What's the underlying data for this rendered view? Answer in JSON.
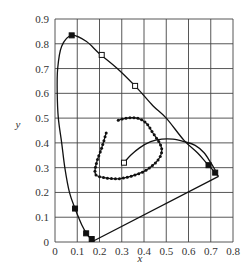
{
  "chart_data": {
    "type": "line",
    "title": "",
    "xlabel": "x",
    "ylabel": "y",
    "xlim": [
      0,
      0.8
    ],
    "ylim": [
      0,
      0.9
    ],
    "grid": true,
    "x_ticks": [
      "0",
      "0.1",
      "0.2",
      "0.3",
      "0.4",
      "0.5",
      "0.6",
      "0.7",
      "0.8"
    ],
    "y_ticks": [
      "0",
      "0.1",
      "0.2",
      "0.3",
      "0.4",
      "0.5",
      "0.6",
      "0.7",
      "0.8",
      "0.9"
    ],
    "series": [
      {
        "name": "spectral-locus",
        "style": "solid",
        "points": [
          [
            0.175,
            0.005
          ],
          [
            0.16,
            0.015
          ],
          [
            0.145,
            0.03
          ],
          [
            0.12,
            0.07
          ],
          [
            0.09,
            0.135
          ],
          [
            0.065,
            0.2
          ],
          [
            0.045,
            0.295
          ],
          [
            0.03,
            0.4
          ],
          [
            0.015,
            0.5
          ],
          [
            0.01,
            0.6
          ],
          [
            0.012,
            0.7
          ],
          [
            0.03,
            0.79
          ],
          [
            0.075,
            0.834
          ],
          [
            0.14,
            0.81
          ],
          [
            0.2,
            0.76
          ],
          [
            0.28,
            0.7
          ],
          [
            0.37,
            0.62
          ],
          [
            0.44,
            0.55
          ],
          [
            0.5,
            0.5
          ],
          [
            0.58,
            0.41
          ],
          [
            0.64,
            0.36
          ],
          [
            0.68,
            0.32
          ],
          [
            0.71,
            0.29
          ],
          [
            0.735,
            0.265
          ]
        ]
      },
      {
        "name": "purple-line",
        "style": "solid",
        "points": [
          [
            0.175,
            0.005
          ],
          [
            0.735,
            0.265
          ]
        ]
      },
      {
        "name": "dotted-loop",
        "style": "dotted-markers",
        "points": [
          [
            0.23,
            0.44
          ],
          [
            0.21,
            0.38
          ],
          [
            0.19,
            0.33
          ],
          [
            0.18,
            0.29
          ],
          [
            0.185,
            0.27
          ],
          [
            0.22,
            0.26
          ],
          [
            0.28,
            0.255
          ],
          [
            0.34,
            0.265
          ],
          [
            0.4,
            0.285
          ],
          [
            0.44,
            0.31
          ],
          [
            0.47,
            0.34
          ],
          [
            0.48,
            0.37
          ],
          [
            0.47,
            0.4
          ],
          [
            0.44,
            0.44
          ],
          [
            0.41,
            0.48
          ],
          [
            0.37,
            0.5
          ],
          [
            0.32,
            0.5
          ],
          [
            0.28,
            0.49
          ]
        ]
      },
      {
        "name": "planckian-curve",
        "style": "solid",
        "points": [
          [
            0.31,
            0.32
          ],
          [
            0.34,
            0.35
          ],
          [
            0.38,
            0.38
          ],
          [
            0.43,
            0.405
          ],
          [
            0.48,
            0.415
          ],
          [
            0.53,
            0.415
          ],
          [
            0.58,
            0.405
          ],
          [
            0.63,
            0.39
          ],
          [
            0.67,
            0.36
          ],
          [
            0.7,
            0.32
          ],
          [
            0.72,
            0.29
          ]
        ]
      }
    ],
    "markers": [
      {
        "label": "filled-square",
        "x": 0.075,
        "y": 0.834
      },
      {
        "label": "open-square",
        "x": 0.21,
        "y": 0.755
      },
      {
        "label": "open-square",
        "x": 0.36,
        "y": 0.63
      },
      {
        "label": "open-square",
        "x": 0.31,
        "y": 0.32
      },
      {
        "label": "filled-square",
        "x": 0.69,
        "y": 0.31
      },
      {
        "label": "filled-square",
        "x": 0.72,
        "y": 0.28
      },
      {
        "label": "filled-square",
        "x": 0.09,
        "y": 0.135
      },
      {
        "label": "filled-square",
        "x": 0.14,
        "y": 0.035
      },
      {
        "label": "filled-square",
        "x": 0.165,
        "y": 0.012
      }
    ]
  }
}
